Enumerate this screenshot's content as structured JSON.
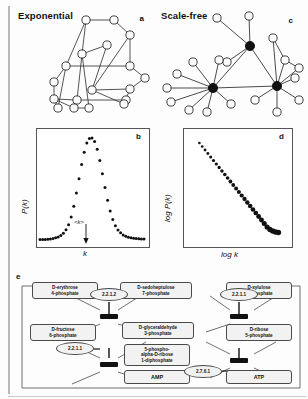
{
  "figure": {
    "panels": {
      "a": {
        "letter": "a",
        "title": "Exponential"
      },
      "b": {
        "letter": "b",
        "ylabel": "P(k)",
        "xlabel": "k",
        "mean_annotation": "<k>"
      },
      "c": {
        "letter": "c",
        "title": "Scale-free"
      },
      "d": {
        "letter": "d",
        "ylabel": "log P(k)",
        "xlabel": "log k"
      },
      "e": {
        "letter": "e"
      }
    }
  },
  "chart_data": [
    {
      "type": "line",
      "panel": "b",
      "title": "",
      "xlabel": "k",
      "ylabel": "P(k)",
      "grid": false,
      "legend": "none",
      "annotations": [
        "<k>"
      ],
      "xlim": [
        0,
        40
      ],
      "ylim": [
        0,
        1
      ],
      "x": [
        0,
        1,
        2,
        3,
        4,
        5,
        6,
        7,
        8,
        9,
        10,
        11,
        12,
        13,
        14,
        15,
        16,
        17,
        18,
        19,
        20,
        21,
        22,
        23,
        24,
        25,
        26,
        27,
        28,
        29,
        30,
        31,
        32,
        33,
        34,
        35,
        36,
        37,
        38,
        39,
        40
      ],
      "values": [
        0.004,
        0.005,
        0.006,
        0.008,
        0.011,
        0.015,
        0.021,
        0.03,
        0.044,
        0.066,
        0.1,
        0.15,
        0.225,
        0.33,
        0.46,
        0.6,
        0.74,
        0.86,
        0.95,
        0.995,
        1.0,
        0.965,
        0.89,
        0.78,
        0.65,
        0.515,
        0.39,
        0.285,
        0.2,
        0.14,
        0.098,
        0.07,
        0.05,
        0.036,
        0.027,
        0.021,
        0.017,
        0.014,
        0.012,
        0.01,
        0.009
      ]
    },
    {
      "type": "scatter",
      "panel": "d",
      "title": "",
      "xlabel": "log k",
      "ylabel": "log P(k)",
      "grid": false,
      "legend": "none",
      "xlim": [
        0,
        1
      ],
      "ylim": [
        0,
        1
      ],
      "description": "power-law degree distribution, straight declining line on log-log axes",
      "x": [
        0.1,
        0.13,
        0.16,
        0.19,
        0.22,
        0.25,
        0.28,
        0.31,
        0.34,
        0.37,
        0.4,
        0.43,
        0.46,
        0.49,
        0.52,
        0.55,
        0.58,
        0.61,
        0.64,
        0.67,
        0.7,
        0.73,
        0.76,
        0.79,
        0.82,
        0.85,
        0.88,
        0.91,
        0.94
      ],
      "values": [
        0.95,
        0.915,
        0.88,
        0.845,
        0.81,
        0.775,
        0.74,
        0.705,
        0.67,
        0.635,
        0.6,
        0.565,
        0.53,
        0.495,
        0.46,
        0.425,
        0.39,
        0.355,
        0.32,
        0.285,
        0.25,
        0.215,
        0.18,
        0.145,
        0.11,
        0.085,
        0.07,
        0.06,
        0.055
      ]
    }
  ],
  "pathway": {
    "metabolites": [
      {
        "id": "e4p",
        "label": "D-erythrose\n4-phosphate"
      },
      {
        "id": "s7p",
        "label": "D-sedoheptulose\n7-phosphate"
      },
      {
        "id": "x5p",
        "label": "D-xylulose\n5-phosphate"
      },
      {
        "id": "f6p",
        "label": "D-fructose\n6-phosphate"
      },
      {
        "id": "g3p",
        "label": "D-glyceraldehyde\n3-phosphate"
      },
      {
        "id": "r5p",
        "label": "D-ribose\n5-phosphate"
      },
      {
        "id": "prpp",
        "label": "5-phospho-\nalpha-D-ribose\n1-diphosphate"
      },
      {
        "id": "amp",
        "label": "AMP"
      },
      {
        "id": "atp",
        "label": "ATP"
      }
    ],
    "enzymes": [
      {
        "id": "ec1",
        "label": "2.2.1.2"
      },
      {
        "id": "ec2",
        "label": "2.2.1.1"
      },
      {
        "id": "ec3",
        "label": "2.2.1.1"
      },
      {
        "id": "ec4",
        "label": "2.7.6.1"
      }
    ]
  }
}
